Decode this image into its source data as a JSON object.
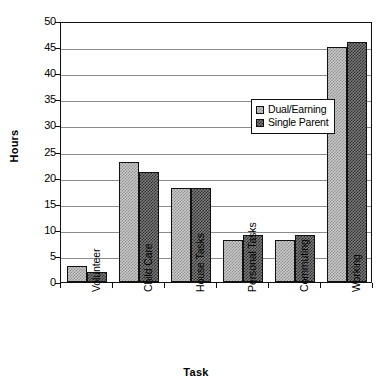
{
  "chart_data": {
    "type": "bar",
    "title": "",
    "xlabel": "Task",
    "ylabel": "Hours",
    "categories": [
      "Volunteer",
      "Child Care",
      "House Tasks",
      "Personal Tasks",
      "Commuting",
      "Working"
    ],
    "series": [
      {
        "name": "Dual/Earning",
        "values": [
          3,
          23,
          18,
          8,
          8,
          45
        ]
      },
      {
        "name": "Single Parent",
        "values": [
          2,
          21,
          18,
          9,
          9,
          46
        ]
      }
    ],
    "ylim": [
      0,
      50
    ],
    "ytick_labels": [
      "0",
      "5",
      "10",
      "15",
      "20",
      "25",
      "30",
      "35",
      "40",
      "45",
      "50"
    ],
    "ytick_values": [
      0,
      5,
      10,
      15,
      20,
      25,
      30,
      35,
      40,
      45,
      50
    ],
    "grid": "horizontal",
    "legend_position": "upper-center",
    "colors": {
      "series_1_fill": "#c9c9c9",
      "series_1_pattern": "#8f8f8f",
      "series_2_fill": "#7a7a7a",
      "series_2_pattern": "#2e2e2e",
      "outline": "#111111",
      "gridline": "#8c8c8c",
      "background": "#ffffff"
    }
  }
}
